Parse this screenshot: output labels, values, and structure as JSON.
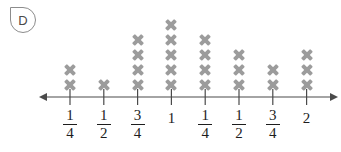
{
  "badge": {
    "letter": "D"
  },
  "chart_data": {
    "type": "line-plot",
    "title": "",
    "xlabel": "",
    "ylabel": "",
    "mark": "X",
    "grid": false,
    "legend": false,
    "total_marks": 24,
    "categories": [
      "1/4",
      "1/2",
      "3/4",
      "1",
      "1/4",
      "1/2",
      "3/4",
      "2"
    ],
    "values": [
      2,
      1,
      4,
      5,
      4,
      3,
      2,
      3
    ],
    "points": [
      {
        "label_numerator": "1",
        "label_denominator": "4",
        "is_fraction": true,
        "label": "1/4",
        "count": 2
      },
      {
        "label_numerator": "1",
        "label_denominator": "2",
        "is_fraction": true,
        "label": "1/2",
        "count": 1
      },
      {
        "label_numerator": "3",
        "label_denominator": "4",
        "is_fraction": true,
        "label": "3/4",
        "count": 4
      },
      {
        "label_numerator": "1",
        "label_denominator": "",
        "is_fraction": false,
        "label": "1",
        "count": 5
      },
      {
        "label_numerator": "1",
        "label_denominator": "4",
        "is_fraction": true,
        "label": "1/4",
        "count": 4
      },
      {
        "label_numerator": "1",
        "label_denominator": "2",
        "is_fraction": true,
        "label": "1/2",
        "count": 3
      },
      {
        "label_numerator": "3",
        "label_denominator": "4",
        "is_fraction": true,
        "label": "3/4",
        "count": 2
      },
      {
        "label_numerator": "2",
        "label_denominator": "",
        "is_fraction": false,
        "label": "2",
        "count": 3
      }
    ]
  },
  "colors": {
    "mark": "#9c9c9c",
    "axis": "#4a4a4a",
    "text": "#1d1d1d",
    "badge_border": "#8c8c8c"
  }
}
